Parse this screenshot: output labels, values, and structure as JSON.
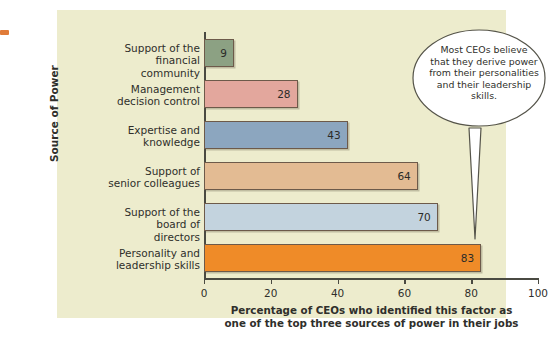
{
  "chart_data": {
    "type": "bar",
    "orientation": "horizontal",
    "title": "",
    "xlabel": "Percentage of CEOs who identified this factor as one of the top three sources of power in their jobs",
    "ylabel": "Source of Power",
    "xlim": [
      0,
      100
    ],
    "xticks": [
      0,
      20,
      40,
      60,
      80,
      100
    ],
    "grid": false,
    "legend": "none",
    "categories": [
      "Support of the financial community",
      "Management decision control",
      "Expertise and knowledge",
      "Support of senior colleagues",
      "Support of the board of directors",
      "Personality and leadership skills"
    ],
    "values": [
      9,
      28,
      43,
      64,
      70,
      83
    ],
    "bar_colors": [
      "#8ca183",
      "#e3a79d",
      "#8ca6bf",
      "#e3bb93",
      "#c3d3de",
      "#ef8b28"
    ],
    "annotation": "Most CEOs believe that they derive power from their personalities and their leadership skills.",
    "annotation_points_to": "Personality and leadership skills"
  },
  "axis": {
    "y_title": "Source of Power",
    "x_caption_line1": "Percentage of CEOs who identified this factor as",
    "x_caption_line2": "one of the top three sources of power in their jobs",
    "tick_labels": [
      "0",
      "20",
      "40",
      "60",
      "80",
      "100"
    ]
  },
  "categories": [
    {
      "line1": "Support of the",
      "line2": "financial community",
      "value": "9"
    },
    {
      "line1": "Management",
      "line2": "decision control",
      "value": "28"
    },
    {
      "line1": "Expertise and",
      "line2": "knowledge",
      "value": "43"
    },
    {
      "line1": "Support of",
      "line2": "senior colleagues",
      "value": "64"
    },
    {
      "line1": "Support of the",
      "line2": "board of directors",
      "value": "70"
    },
    {
      "line1": "Personality and",
      "line2": "leadership skills",
      "value": "83"
    }
  ],
  "callout": {
    "line1": "Most CEOs believe",
    "line2": "that they derive power",
    "line3": "from their personalities",
    "line4": "and their leadership",
    "line5": "skills."
  },
  "colors": {
    "panel_background": "#edeccd",
    "axis": "#4a4a42",
    "bar_border": "#6d5a4a",
    "edge_mark": "#e07b39",
    "bubble_fill": "#ffffff",
    "bubble_stroke": "#55544a"
  }
}
